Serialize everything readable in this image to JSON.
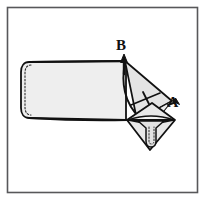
{
  "figure": {
    "kind": "instructional-line-drawing",
    "frame": {
      "border_color": "#58585a",
      "background_color": "#ffffff",
      "x": 7,
      "y": 7,
      "width": 191,
      "height": 186
    },
    "palette": {
      "outline": "#111111",
      "body_fill": "#eeeeee",
      "flap_fill": "#e4e4e4",
      "pocket_fill": "#e8e8e8",
      "stitch": "#2a2a2a",
      "label": "#111111"
    },
    "labels": [
      {
        "id": "label-b",
        "text": "B",
        "x": 121,
        "y": 50,
        "points_to": "upper fold vertex",
        "arrow": {
          "from_x": 124,
          "from_y": 72,
          "to_x": 124,
          "to_y": 56
        }
      },
      {
        "id": "label-a",
        "text": "A",
        "x": 173,
        "y": 107,
        "points_to": "right diamond vertex",
        "arrow": {
          "from_x": 166,
          "from_y": 108,
          "to_x": 176,
          "to_y": 101
        }
      }
    ],
    "parts": [
      {
        "id": "main-body",
        "name": "main fabric body",
        "note": "rounded left end with dashed seam"
      },
      {
        "id": "corner-flap",
        "name": "folded triangular corner flap"
      },
      {
        "id": "diamond-pocket",
        "name": "diamond shaped folded corner"
      },
      {
        "id": "t-tab",
        "name": "T shaped tab / strap detail"
      },
      {
        "id": "fold-curve",
        "name": "curved fold line from B"
      },
      {
        "id": "fold-tick",
        "name": "perpendicular tick mark on fold"
      }
    ]
  }
}
